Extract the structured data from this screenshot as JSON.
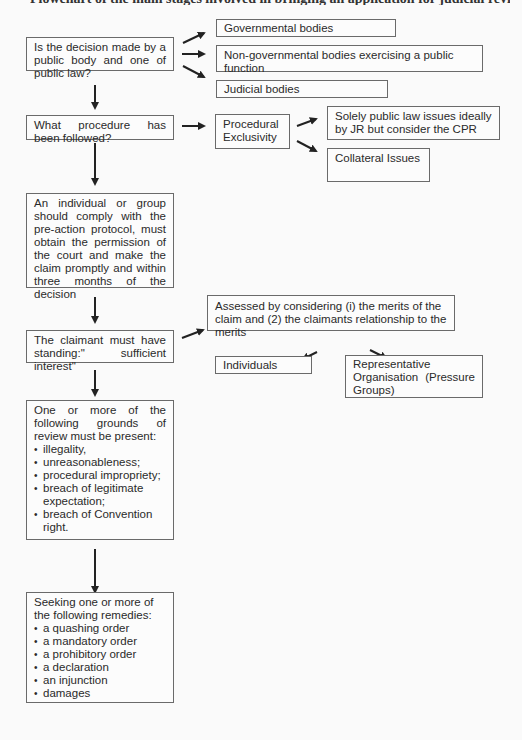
{
  "header_cutoff": "Flowchart of the main stages involved in bringing an application for judicial review",
  "main_flow": [
    {
      "id": "q_public_body",
      "text": "Is the decision made by a public body and one of public law?"
    },
    {
      "id": "q_procedure",
      "text": "What procedure has been followed?"
    },
    {
      "id": "protocol",
      "text": "An individual or group should comply with the pre-action protocol, must obtain the permission of the court and make the claim promptly and within three months of the decision"
    },
    {
      "id": "standing",
      "text": "The claimant must have standing:\" sufficient interest\""
    },
    {
      "id": "grounds",
      "intro": "One or more of the following grounds of review must be present:",
      "items": [
        "illegality,",
        "unreasonableness;",
        "procedural impropriety;",
        "breach of legitimate expectation;",
        "breach of Convention right."
      ]
    },
    {
      "id": "remedies",
      "intro": "Seeking one or more of the following remedies:",
      "items": [
        "a quashing order",
        "a mandatory order",
        "a prohibitory order",
        "a declaration",
        "an injunction",
        "damages"
      ]
    }
  ],
  "public_bodies": [
    "Governmental bodies",
    "Non-governmental bodies exercising a public function",
    "Judicial bodies"
  ],
  "procedure": {
    "label": "Procedural Exclusivity",
    "options": [
      "Solely public law issues ideally by JR but consider the CPR",
      "Collateral Issues"
    ]
  },
  "standing_assessment": {
    "text": "Assessed by considering (i) the merits of the claim and (2) the claimants relationship to the merits",
    "options": [
      "Individuals",
      "Representative Organisation (Pressure Groups)"
    ]
  },
  "colors": {
    "border": "#6a6a6a",
    "arrow": "#222222",
    "background": "#fafafa"
  }
}
